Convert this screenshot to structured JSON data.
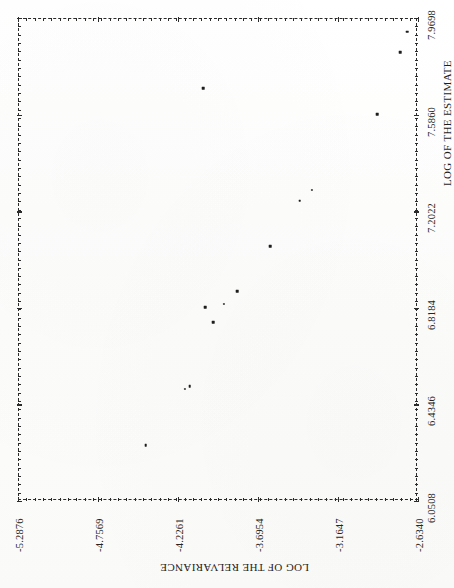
{
  "chart_data": {
    "type": "scatter",
    "title": "",
    "xlabel": "LOG OF THE ESTIMATE",
    "ylabel": "LOG OF THE RELVARIANCE",
    "xlim": [
      6.0508,
      7.9698
    ],
    "ylim": [
      -5.2876,
      -2.634
    ],
    "grid": false,
    "legend": null,
    "orientation": "rotated-90-scanned",
    "xticklabels": [
      "6.0508",
      "6.4346",
      "6.8184",
      "7.2022",
      "7.5860",
      "7.9698"
    ],
    "xticks": [
      6.0508,
      6.4346,
      6.8184,
      7.2022,
      7.586,
      7.9698
    ],
    "yticklabels": [
      "-2.6340",
      "-3.1647",
      "-3.6954",
      "-4.2261",
      "-4.7569",
      "-5.2876"
    ],
    "yticks": [
      -2.634,
      -3.1647,
      -3.6954,
      -4.2261,
      -4.7569,
      -5.2876
    ],
    "points": [
      {
        "x": 7.915,
        "y": -2.706
      },
      {
        "x": 7.834,
        "y": -2.752
      },
      {
        "x": 7.588,
        "y": -2.903
      },
      {
        "x": 7.286,
        "y": -3.34
      },
      {
        "x": 7.244,
        "y": -3.42
      },
      {
        "x": 7.062,
        "y": -3.615
      },
      {
        "x": 6.885,
        "y": -3.835
      },
      {
        "x": 6.833,
        "y": -3.923
      },
      {
        "x": 6.82,
        "y": -4.045
      },
      {
        "x": 6.76,
        "y": -3.992
      },
      {
        "x": 6.508,
        "y": -4.148
      },
      {
        "x": 6.496,
        "y": -4.178
      },
      {
        "x": 6.272,
        "y": -4.44
      },
      {
        "x": 7.692,
        "y": -4.06
      }
    ],
    "npoints": 14,
    "description": "Scatter plot of log of the relvariance versus log of the estimate; points follow a decreasing monotone trend."
  },
  "axes": {
    "x_axis_name": "log-of-the-estimate-axis",
    "y_axis_name": "log-of-the-relvariance-axis"
  },
  "document": {
    "page_background": "#fdfdfc",
    "ink_color": "#1d1d1d"
  }
}
